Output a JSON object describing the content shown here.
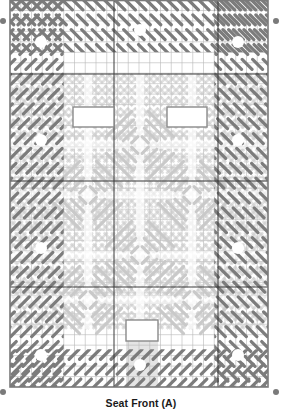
{
  "caption": "Seat Front (A)",
  "canvas": {
    "x": 10,
    "y": 0,
    "width": 258,
    "height": 387,
    "cols": 24,
    "rows": 37,
    "major_x": [
      114,
      218
    ],
    "major_y": [
      74,
      181,
      287
    ]
  },
  "colors": {
    "background": "#ffffff",
    "grid_minor": "#b8b8b8",
    "grid_major": "#3a3a3a",
    "border": "#7a7a7a",
    "stitch_dark": "#7c7c7c",
    "stitch_light": "#c9c9c9",
    "shaded_column": "#e4e4e4",
    "cutout_fill": "#ffffff",
    "cutout_stroke": "#8a8a8a",
    "dot": "#7a7a7a"
  },
  "cutouts": [
    {
      "name": "cutout-left",
      "x": 73,
      "y": 107,
      "w": 41,
      "h": 20
    },
    {
      "name": "cutout-right",
      "x": 167,
      "y": 107,
      "w": 40,
      "h": 20
    },
    {
      "name": "cutout-bottom",
      "x": 126,
      "y": 320,
      "w": 32,
      "h": 21
    }
  ],
  "shaded_region": {
    "x": 126,
    "y": 341,
    "w": 32,
    "h": 46
  },
  "dots": [
    {
      "name": "corner-dot-top-left",
      "cx": 3,
      "cy": 21
    },
    {
      "name": "corner-dot-top-right",
      "cx": 276,
      "cy": 21
    },
    {
      "name": "corner-dot-bottom-left",
      "cx": 3,
      "cy": 392
    },
    {
      "name": "corner-dot-bottom-right",
      "cx": 276,
      "cy": 392
    }
  ],
  "motifs": {
    "dark_centers": [
      [
        41,
        42
      ],
      [
        140,
        30
      ],
      [
        238,
        42
      ],
      [
        41,
        140
      ],
      [
        238,
        140
      ],
      [
        41,
        248
      ],
      [
        238,
        248
      ],
      [
        41,
        355
      ],
      [
        140,
        365
      ],
      [
        238,
        355
      ]
    ],
    "light_centers": [
      [
        140,
        145
      ],
      [
        88,
        195
      ],
      [
        192,
        195
      ],
      [
        140,
        255
      ],
      [
        88,
        300
      ],
      [
        192,
        300
      ]
    ]
  }
}
